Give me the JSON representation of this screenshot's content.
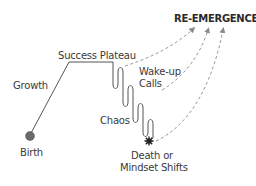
{
  "diagram": {
    "title": "RE-EMERGENCE",
    "stages": [
      {
        "id": "birth",
        "label": "Birth"
      },
      {
        "id": "growth",
        "label": "Growth"
      },
      {
        "id": "success-plateau",
        "label": "Success Plateau"
      },
      {
        "id": "wake-up-calls",
        "label": "Wake-up Calls",
        "lines": [
          "Wake-up",
          "Calls"
        ]
      },
      {
        "id": "chaos",
        "label": "Chaos"
      },
      {
        "id": "death-or-mindset-shifts",
        "label": "Death or Mindset Shifts",
        "lines": [
          "Death or",
          "Mindset Shifts"
        ]
      }
    ],
    "arrows": [
      {
        "from": "success-plateau",
        "to": "re-emergence",
        "style": "dashed"
      },
      {
        "from": "wake-up-calls",
        "to": "re-emergence",
        "style": "dashed"
      },
      {
        "from": "death-or-mindset-shifts",
        "to": "re-emergence",
        "style": "dashed"
      }
    ],
    "colors": {
      "line": "#444444",
      "dashed": "#999999",
      "birth_dot": "#6a6a6a",
      "text": "#3a3a3a"
    }
  }
}
